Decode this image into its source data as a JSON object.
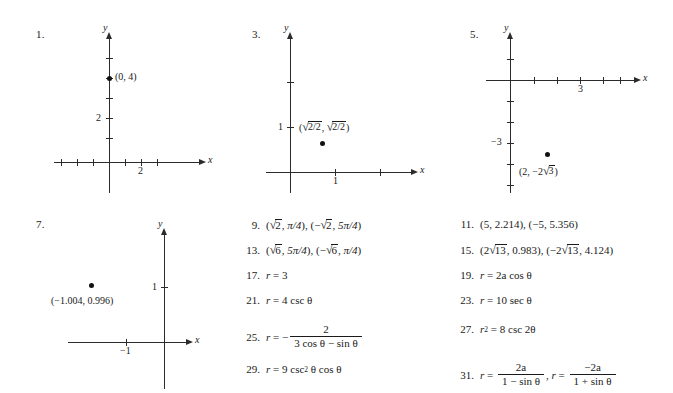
{
  "page": {
    "kind": "textbook-answer-key",
    "background": "#ffffff",
    "ink": "#1a1a1a"
  },
  "graphs": [
    {
      "number": "1.",
      "x_axis_label": "x",
      "y_axis_label": "y",
      "x_tick_label": "2",
      "y_tick_label": "2",
      "point_label": "(0, 4)",
      "point": {
        "x": 0,
        "y": 4
      },
      "x_ticks": [
        -4,
        -3,
        -2,
        1,
        2,
        3
      ],
      "y_ticks": [
        1,
        2,
        3,
        4,
        5
      ]
    },
    {
      "number": "3.",
      "x_axis_label": "x",
      "y_axis_label": "y",
      "x_tick_label": "1",
      "y_tick_label": "1",
      "point_label": "(√2/2, √2/2)",
      "point": {
        "x": 0.707,
        "y": 0.707
      },
      "x_ticks": [
        1,
        2
      ],
      "y_ticks": [
        1,
        2
      ]
    },
    {
      "number": "5.",
      "x_axis_label": "x",
      "y_axis_label": "y",
      "x_tick_label": "3",
      "y_tick_label": "−3",
      "point_label": "(2, −2√3)",
      "point": {
        "x": 2,
        "y": -3.46
      },
      "x_ticks": [
        1,
        2,
        3,
        4,
        5
      ],
      "y_ticks": [
        1,
        -1,
        -2,
        -3,
        -4,
        -5
      ]
    },
    {
      "number": "7.",
      "x_axis_label": "x",
      "y_axis_label": "y",
      "x_tick_label": "−1",
      "y_tick_label": "1",
      "point_label": "(−1.004, 0.996)",
      "point": {
        "x": -1.004,
        "y": 0.996
      },
      "x_ticks": [
        -1
      ],
      "y_ticks": [
        1
      ]
    }
  ],
  "answers_middle": [
    {
      "number": "9.",
      "text": "(√2, π/4), (−√2, 5π/4)"
    },
    {
      "number": "13.",
      "text": "(√6, 5π/4), (−√6, π/4)"
    },
    {
      "number": "17.",
      "text": "r = 3"
    },
    {
      "number": "21.",
      "text": "r = 4 csc θ"
    },
    {
      "number": "25.",
      "text": "r = − 2 / (3 cos θ − sin θ)"
    },
    {
      "number": "29.",
      "text": "r = 9 csc² θ cos θ"
    }
  ],
  "answers_right": [
    {
      "number": "11.",
      "text": "(5, 2.214), (−5, 5.356)"
    },
    {
      "number": "15.",
      "text": "(2√13, 0.983), (−2√13, 4.124)"
    },
    {
      "number": "19.",
      "text": "r = 2a cos θ"
    },
    {
      "number": "23.",
      "text": "r = 10 sec θ"
    },
    {
      "number": "27.",
      "text": "r² = 8 csc 2θ"
    },
    {
      "number": "31.",
      "text": "r = 2a / (1 − sin θ), r = −2a / (1 + sin θ)"
    }
  ],
  "tokens": {
    "eq": "=",
    "minus": "−",
    "plus": "+",
    "comma": ",",
    "lparen": "(",
    "rparen": ")",
    "r": "r",
    "a": "a",
    "theta": "θ",
    "pi": "π",
    "cos": "cos",
    "sin": "sin",
    "csc": "csc",
    "sec": "sec",
    "two": "2",
    "three": "3",
    "four": "4",
    "six": "6",
    "eight": "8",
    "nine": "9",
    "ten": "10",
    "thirteen": "13",
    "sq": "2",
    "pi_over_4": "π/4",
    "five_pi_over_4": "5π/4",
    "p11_a": "(5, 2.214), (−5, 5.356)",
    "p15_pre": "(2",
    "p15_mid": ", 0.983), (−2",
    "p15_post": ", 4.124)",
    "p19": "2a cos θ",
    "p23": "10 sec θ",
    "p27_lhs": "r",
    "p27_rhs": "8 csc 2θ",
    "p25_num": "2",
    "p25_den": "3 cos θ − sin θ",
    "p29": "9 csc",
    "p29_tail": "θ cos θ",
    "p31_num1": "2a",
    "p31_den1": "1 − sin θ",
    "p31_num2": "−2a",
    "p31_den2": "1 + sin θ",
    "p17": "3",
    "p21": "4 csc θ"
  }
}
